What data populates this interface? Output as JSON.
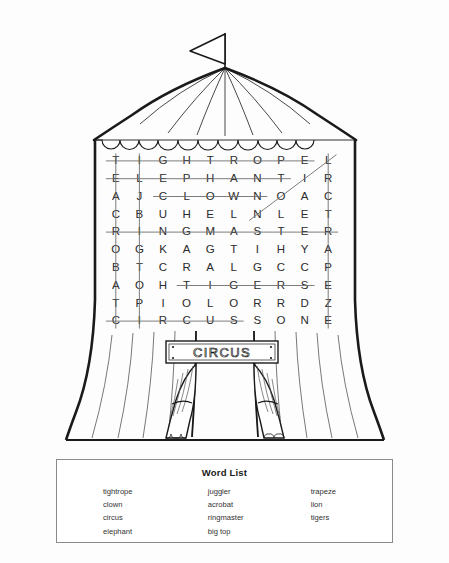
{
  "puzzle": {
    "type": "word-search",
    "theme": "circus",
    "sign_label": "CIRCUS",
    "grid_rows": 10,
    "grid_cols": 10,
    "grid": [
      [
        "T",
        "I",
        "G",
        "H",
        "T",
        "R",
        "O",
        "P",
        "E",
        "L"
      ],
      [
        "E",
        "L",
        "E",
        "P",
        "H",
        "A",
        "N",
        "T",
        "I",
        "R"
      ],
      [
        "A",
        "J",
        "C",
        "L",
        "O",
        "W",
        "N",
        "O",
        "A",
        "C"
      ],
      [
        "C",
        "B",
        "U",
        "H",
        "E",
        "L",
        "N",
        "L",
        "E",
        "T"
      ],
      [
        "R",
        "I",
        "N",
        "G",
        "M",
        "A",
        "S",
        "T",
        "E",
        "R"
      ],
      [
        "O",
        "G",
        "K",
        "A",
        "G",
        "T",
        "I",
        "H",
        "Y",
        "A"
      ],
      [
        "B",
        "T",
        "C",
        "R",
        "A",
        "L",
        "G",
        "C",
        "C",
        "P"
      ],
      [
        "A",
        "O",
        "H",
        "T",
        "I",
        "G",
        "E",
        "R",
        "S",
        "E"
      ],
      [
        "T",
        "P",
        "I",
        "O",
        "L",
        "O",
        "R",
        "R",
        "D",
        "Z"
      ],
      [
        "C",
        "I",
        "R",
        "C",
        "U",
        "S",
        "S",
        "O",
        "N",
        "E"
      ]
    ],
    "solutions": [
      {
        "word": "tightrope",
        "direction": "horizontal",
        "row": 1,
        "col_start": 1,
        "col_end": 9
      },
      {
        "word": "elephant",
        "direction": "horizontal",
        "row": 2,
        "col_start": 1,
        "col_end": 8
      },
      {
        "word": "clown",
        "direction": "horizontal",
        "row": 3,
        "col_start": 3,
        "col_end": 7
      },
      {
        "word": "ringmaster",
        "direction": "horizontal",
        "row": 5,
        "col_start": 1,
        "col_end": 10
      },
      {
        "word": "tigers",
        "direction": "horizontal",
        "row": 8,
        "col_start": 4,
        "col_end": 9
      },
      {
        "word": "circus",
        "direction": "horizontal",
        "row": 10,
        "col_start": 1,
        "col_end": 6
      },
      {
        "word": "acrobat",
        "direction": "vertical",
        "col": 1,
        "row_start": 1,
        "row_end": 10
      },
      {
        "word": "big top",
        "direction": "vertical",
        "col": 2,
        "row_start": 1,
        "row_end": 10
      },
      {
        "word": "trapeze",
        "direction": "vertical",
        "col": 10,
        "row_start": 1,
        "row_end": 10
      },
      {
        "word": "lion",
        "direction": "diagonal",
        "row_start": 4,
        "col_start": 7,
        "row_end": 1,
        "col_end": 10
      }
    ]
  },
  "word_list": {
    "title": "Word List",
    "columns": [
      [
        "tightrope",
        "clown",
        "circus",
        "elephant"
      ],
      [
        "juggler",
        "acrobat",
        "ringmaster",
        "big top"
      ],
      [
        "trapeze",
        "lion",
        "tigers"
      ]
    ]
  },
  "colors": {
    "ink": "#1a1a1a",
    "letter": "#2b2b2b",
    "strike": "#6e6e6e",
    "box_border": "#8a8a8a",
    "page": "#fdfdfd"
  }
}
